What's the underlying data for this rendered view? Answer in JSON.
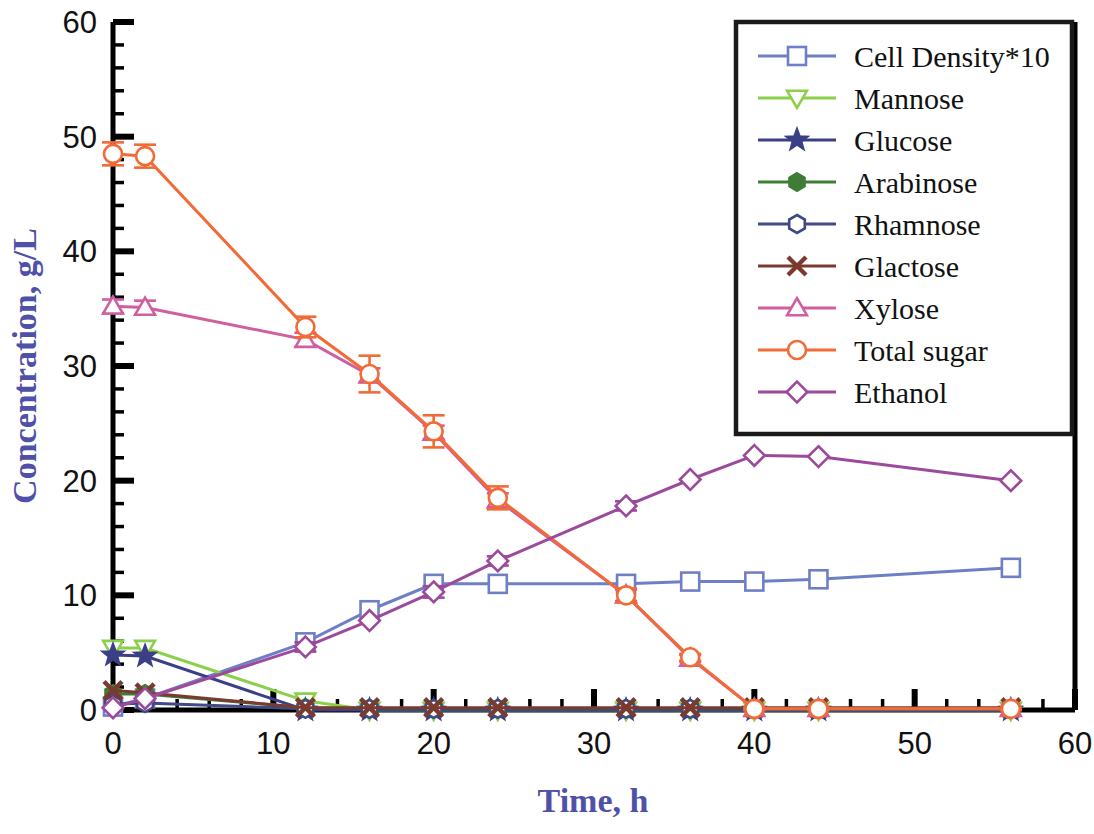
{
  "chart_data": {
    "type": "line",
    "title": "",
    "xlabel": "Time, h",
    "ylabel": "Concentration, g/L",
    "xlim": [
      0,
      60
    ],
    "ylim": [
      0,
      60
    ],
    "xticks": [
      0,
      10,
      20,
      30,
      40,
      50,
      60
    ],
    "yticks": [
      0,
      10,
      20,
      30,
      40,
      50,
      60
    ],
    "xtick_labels": [
      "0",
      "10",
      "20",
      "30",
      "40",
      "50",
      "60"
    ],
    "ytick_labels": [
      "0",
      "10",
      "20",
      "30",
      "40",
      "50",
      "60"
    ],
    "x_minor_step": 2,
    "y_minor_step": 2,
    "grid": false,
    "legend_position": "top-right",
    "x": [
      0,
      2,
      12,
      16,
      20,
      24,
      32,
      36,
      40,
      44,
      56
    ],
    "series": [
      {
        "name": "Cell Density*10",
        "color": "#6f7fc6",
        "marker": "square",
        "values": [
          0.3,
          1.0,
          5.9,
          8.7,
          11.0,
          11.0,
          11.0,
          11.2,
          11.2,
          11.4,
          12.4
        ],
        "errors": [
          0,
          0,
          0,
          0,
          0,
          0,
          0,
          0,
          0,
          0,
          0
        ]
      },
      {
        "name": "Mannose",
        "color": "#8bd04a",
        "marker": "triangle-down",
        "values": [
          5.4,
          5.4,
          0.8,
          0.0,
          0.0,
          0.0,
          0.0,
          0.0,
          0.0,
          0.0,
          0.0
        ],
        "errors": [
          0,
          0,
          0,
          0,
          0,
          0,
          0,
          0,
          0,
          0,
          0
        ]
      },
      {
        "name": "Glucose",
        "color": "#3b3f86",
        "marker": "star",
        "values": [
          4.8,
          4.7,
          0.0,
          0.0,
          0.0,
          0.0,
          0.0,
          0.0,
          0.0,
          0.0,
          0.0
        ],
        "errors": [
          0,
          0,
          0,
          0,
          0,
          0,
          0,
          0,
          0,
          0,
          0
        ]
      },
      {
        "name": "Arabinose",
        "color": "#3f7c38",
        "marker": "hexagon-filled",
        "values": [
          1.4,
          1.4,
          0.2,
          0.1,
          0.1,
          0.1,
          0.1,
          0.1,
          0.1,
          0.1,
          0.1
        ],
        "errors": [
          0,
          0,
          0,
          0,
          0,
          0,
          0,
          0,
          0,
          0,
          0
        ]
      },
      {
        "name": "Rhamnose",
        "color": "#3f4a86",
        "marker": "hexagon",
        "values": [
          0.5,
          0.6,
          0.1,
          0.1,
          0.1,
          0.1,
          0.1,
          0.1,
          0.1,
          0.1,
          0.1
        ],
        "errors": [
          0,
          0,
          0,
          0,
          0,
          0,
          0,
          0,
          0,
          0,
          0
        ]
      },
      {
        "name": "Glactose",
        "color": "#7a3b2e",
        "marker": "cross",
        "values": [
          1.7,
          1.5,
          0.2,
          0.2,
          0.2,
          0.2,
          0.2,
          0.2,
          0.2,
          0.2,
          0.2
        ],
        "errors": [
          0,
          0,
          0,
          0,
          0,
          0,
          0,
          0,
          0,
          0,
          0
        ]
      },
      {
        "name": "Xylose",
        "color": "#cf5fa0",
        "marker": "triangle-up",
        "values": [
          35.2,
          35.1,
          32.3,
          29.2,
          24.2,
          18.3,
          10.0,
          4.5,
          0.1,
          0.1,
          0.1
        ],
        "errors": [
          0.6,
          0.6,
          0.6,
          0.6,
          0.6,
          0.6,
          0.5,
          0.3,
          0.1,
          0.1,
          0.1
        ]
      },
      {
        "name": "Total sugar",
        "color": "#f26a35",
        "marker": "circle",
        "values": [
          48.5,
          48.3,
          33.4,
          29.3,
          24.3,
          18.5,
          10.0,
          4.6,
          0.1,
          0.1,
          0.1
        ],
        "errors": [
          1.0,
          1.0,
          0.9,
          1.6,
          1.4,
          1.0,
          0.6,
          0.3,
          0.1,
          0.1,
          0.1
        ]
      },
      {
        "name": "Ethanol",
        "color": "#9c4a9c",
        "marker": "diamond",
        "values": [
          0.2,
          1.0,
          5.5,
          7.8,
          10.3,
          13.0,
          17.8,
          20.1,
          22.2,
          22.1,
          20.0
        ],
        "errors": [
          0,
          0,
          0.4,
          0,
          0.5,
          0.4,
          0.4,
          0,
          0,
          0,
          0
        ]
      }
    ]
  },
  "axes": {
    "x_title": "Time, h",
    "y_title": "Concentration, g/L"
  },
  "legend": {
    "entries": [
      {
        "label": "Cell Density*10"
      },
      {
        "label": "Mannose"
      },
      {
        "label": "Glucose"
      },
      {
        "label": "Arabinose"
      },
      {
        "label": "Rhamnose"
      },
      {
        "label": "Glactose"
      },
      {
        "label": "Xylose"
      },
      {
        "label": "Total sugar"
      },
      {
        "label": "Ethanol"
      }
    ]
  },
  "colors": {
    "axis": "#000000",
    "tick_label": "#111111",
    "axis_title": "#4f51a8",
    "background": "#ffffff",
    "legend_border": "#1a1a1a"
  }
}
